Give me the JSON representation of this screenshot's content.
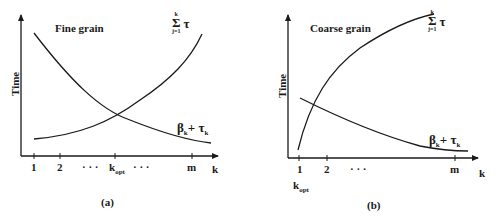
{
  "panels": [
    {
      "id": "a",
      "title": "Fine grain",
      "y_axis_label": "Time",
      "x_axis_label": "k",
      "x_ticks": [
        "1",
        "2",
        "· · ·",
        "k",
        "opt",
        "· · ·",
        "m"
      ],
      "curve_labels": {
        "sum_lower": "j=1",
        "sum_upper": "k",
        "sum_symbol": "Σ",
        "sum_term": "τ",
        "sum_term_sub": "j",
        "beta": "β",
        "beta_sub": "k",
        "plus": "+",
        "tau": "τ",
        "tau_sub": "k"
      },
      "caption": "(a)"
    },
    {
      "id": "b",
      "title": "Coarse grain",
      "y_axis_label": "Time",
      "x_axis_label": "k",
      "x_ticks": [
        "1",
        "2",
        "· · ·",
        "m"
      ],
      "kopt_label": "k",
      "kopt_sub": "opt",
      "curve_labels": {
        "sum_lower": "j=1",
        "sum_upper": "k",
        "sum_symbol": "Σ",
        "sum_term": "τ",
        "sum_term_sub": "j",
        "beta": "β",
        "beta_sub": "k",
        "plus": "+",
        "tau": "τ",
        "tau_sub": "k"
      },
      "caption": "(b)"
    }
  ],
  "colors": {
    "line": "#1a1a1a",
    "background": "#ffffff"
  }
}
